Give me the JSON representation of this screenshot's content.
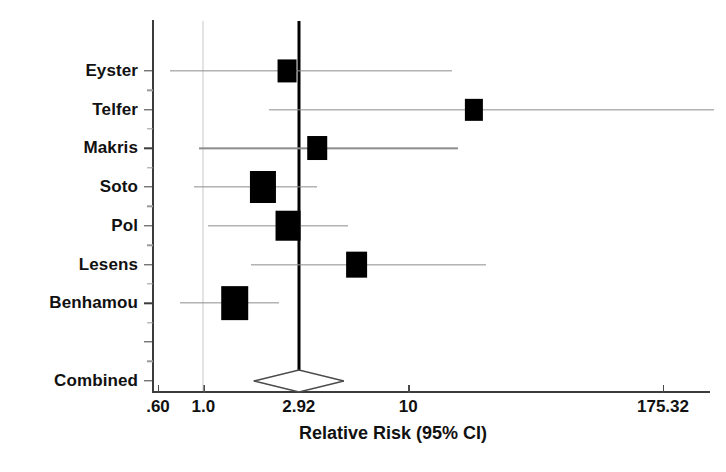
{
  "chart_data": {
    "type": "forest",
    "title": "",
    "xlabel": "Relative Risk (95% CI)",
    "ylabel": "",
    "scale": "log",
    "xlim": [
      0.6,
      175.32
    ],
    "grid": false,
    "legend": "none",
    "reference_line": {
      "label": "2.92",
      "value": 2.92,
      "style": "thick-solid-black"
    },
    "null_line": {
      "value": 1.0,
      "style": "thin-gray"
    },
    "x_ticks": [
      {
        "label": ".60",
        "value": 0.6
      },
      {
        "label": "1.0",
        "value": 1.0
      },
      {
        "label": "2.92",
        "value": 2.92
      },
      {
        "label": "10",
        "value": 10
      },
      {
        "label": "175.32",
        "value": 175.32
      }
    ],
    "categories": [
      "Eyster",
      "Telfer",
      "Makris",
      "Soto",
      "Pol",
      "Lesens",
      "Benhamou",
      "Combined"
    ],
    "studies": [
      {
        "name": "Eyster",
        "estimate": 2.55,
        "ci_low": 0.69,
        "ci_high": 16.4,
        "weight": 7,
        "marker": "square",
        "row": 0
      },
      {
        "name": "Telfer",
        "estimate": 21.0,
        "ci_low": 2.1,
        "ci_high": 310.0,
        "weight": 6,
        "marker": "square",
        "row": 1
      },
      {
        "name": "Makris",
        "estimate": 3.6,
        "ci_low": 0.95,
        "ci_high": 17.5,
        "weight": 8,
        "marker": "square",
        "row": 2
      },
      {
        "name": "Soto",
        "estimate": 1.95,
        "ci_low": 0.9,
        "ci_high": 3.6,
        "weight": 22,
        "marker": "square",
        "row": 3
      },
      {
        "name": "Pol",
        "estimate": 2.6,
        "ci_low": 1.05,
        "ci_high": 5.1,
        "weight": 19,
        "marker": "square",
        "row": 4
      },
      {
        "name": "Lesens",
        "estimate": 5.6,
        "ci_low": 1.7,
        "ci_high": 24.0,
        "weight": 12,
        "marker": "square",
        "row": 5
      },
      {
        "name": "Benhamou",
        "estimate": 1.42,
        "ci_low": 0.77,
        "ci_high": 2.35,
        "weight": 26,
        "marker": "square",
        "row": 6
      },
      {
        "name": "Combined",
        "estimate": 2.92,
        "ci_low": 1.75,
        "ci_high": 4.8,
        "weight": 100,
        "marker": "diamond-open",
        "row": 8
      }
    ]
  }
}
